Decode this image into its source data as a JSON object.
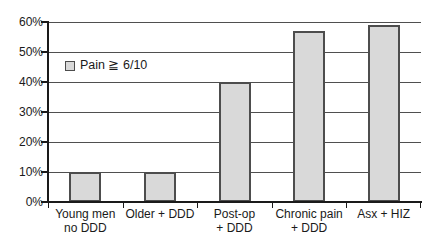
{
  "chart_data": {
    "type": "bar",
    "categories": [
      [
        "Young men",
        "no DDD"
      ],
      [
        "Older + DDD"
      ],
      [
        "Post-op",
        "+ DDD"
      ],
      [
        "Chronic pain",
        "+ DDD"
      ],
      [
        "Asx + HIZ"
      ]
    ],
    "values": [
      10,
      10,
      40,
      57,
      59
    ],
    "legend": "Pain ≧ 6/10",
    "ylim": [
      0,
      60
    ],
    "ytick_step": 10,
    "ytick_labels": [
      "0%",
      "10%",
      "20%",
      "30%",
      "40%",
      "50%",
      "60%"
    ],
    "grid": true,
    "legend_position": "upper-left-inside",
    "colors": {
      "background": "#ffffff",
      "bar_fill": "#d9d9d9",
      "bar_border": "#4d4d4d",
      "gridline": "#4f4f4f",
      "axis": "#1a1a1a",
      "text": "#1a1a1a"
    }
  }
}
